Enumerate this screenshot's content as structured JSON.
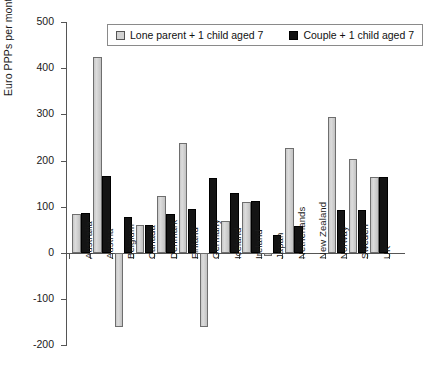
{
  "chart_data": {
    "type": "bar",
    "title": "",
    "subtitle": "",
    "xlabel": "",
    "ylabel": "Euro PPPs per month",
    "ylim": [
      -200,
      500
    ],
    "yticks": [
      500,
      400,
      300,
      200,
      100,
      0,
      -100,
      -200
    ],
    "ytick_labels": [
      "500",
      "400",
      "300",
      "200",
      "100",
      "0",
      "-100",
      "-200"
    ],
    "grid": false,
    "legend_position": "top-center",
    "categories": [
      "Australia",
      "Austria",
      "Belgium",
      "Canada",
      "Denmark",
      "Finland",
      "Germany",
      "Iceland",
      "Ireland",
      "Japan",
      "Netherlands",
      "New Zealand",
      "Norway",
      "Sweden",
      "UK"
    ],
    "series": [
      {
        "name": "Lone parent + 1 child aged 7",
        "color": "#d2d2d2",
        "values": [
          85,
          424,
          -160,
          61,
          124,
          239,
          -160,
          70,
          111,
          -6,
          228,
          0,
          295,
          203,
          165
        ]
      },
      {
        "name": "Couple + 1 child aged 7",
        "color": "#111111",
        "values": [
          86,
          166,
          78,
          61,
          85,
          96,
          163,
          129,
          112,
          39,
          59,
          0,
          94,
          94,
          165
        ]
      }
    ]
  },
  "legend": {
    "items": [
      {
        "label": "Lone parent + 1 child aged 7",
        "swatch": "grey"
      },
      {
        "label": "Couple + 1 child aged 7",
        "swatch": "black"
      }
    ]
  }
}
